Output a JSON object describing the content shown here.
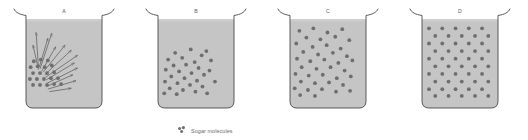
{
  "figure": {
    "title_visible": false,
    "background_color": "#ffffff",
    "liquid_color": "#c5c5c5",
    "liquid_top_highlight": "#cfcfcf",
    "glass_outline_color": "#4a4a4a",
    "molecule_color": "#6e6e6e",
    "arrow_color": "#5f5f5f",
    "label_color": "#5a5a5a"
  },
  "legend": {
    "label": "Sugar molecules",
    "marker_name": "sugar-molecule-cluster",
    "marker_dots": [
      {
        "cx": 2.6,
        "cy": 2.4,
        "r": 1.5
      },
      {
        "cx": 6.4,
        "cy": 1.6,
        "r": 1.6
      },
      {
        "cx": 4.6,
        "cy": 5.4,
        "r": 1.5
      }
    ]
  },
  "beakers": [
    {
      "id": "A",
      "label": "A",
      "x": 14,
      "description": "Sugar crystals clustered at bottom-left, arrows showing molecules dispersing outward",
      "molecule_count": 21,
      "molecules": [
        {
          "cx": 10,
          "cy": 50
        },
        {
          "cx": 19,
          "cy": 48
        },
        {
          "cx": 28,
          "cy": 49
        },
        {
          "cx": 6,
          "cy": 57
        },
        {
          "cx": 15,
          "cy": 56
        },
        {
          "cx": 24,
          "cy": 57
        },
        {
          "cx": 33,
          "cy": 55
        },
        {
          "cx": 9,
          "cy": 64
        },
        {
          "cx": 18,
          "cy": 64
        },
        {
          "cx": 27,
          "cy": 64
        },
        {
          "cx": 36,
          "cy": 63
        },
        {
          "cx": 5,
          "cy": 71
        },
        {
          "cx": 14,
          "cy": 71
        },
        {
          "cx": 23,
          "cy": 71
        },
        {
          "cx": 32,
          "cy": 70
        },
        {
          "cx": 41,
          "cy": 70
        },
        {
          "cx": 9,
          "cy": 78
        },
        {
          "cx": 18,
          "cy": 78
        },
        {
          "cx": 27,
          "cy": 78
        },
        {
          "cx": 36,
          "cy": 77
        },
        {
          "cx": 45,
          "cy": 77
        }
      ],
      "arrows": [
        {
          "x1": 16,
          "y1": 58,
          "x2": 13,
          "y2": 16
        },
        {
          "x1": 17,
          "y1": 57,
          "x2": 28,
          "y2": 23
        },
        {
          "x1": 16,
          "y1": 60,
          "x2": 9,
          "y2": 31
        },
        {
          "x1": 18,
          "y1": 59,
          "x2": 33,
          "y2": 17
        },
        {
          "x1": 20,
          "y1": 62,
          "x2": 38,
          "y2": 33
        },
        {
          "x1": 22,
          "y1": 63,
          "x2": 50,
          "y2": 31
        },
        {
          "x1": 24,
          "y1": 66,
          "x2": 58,
          "y2": 37
        },
        {
          "x1": 25,
          "y1": 69,
          "x2": 66,
          "y2": 43
        },
        {
          "x1": 26,
          "y1": 72,
          "x2": 62,
          "y2": 52
        },
        {
          "x1": 27,
          "y1": 76,
          "x2": 66,
          "y2": 58
        },
        {
          "x1": 26,
          "y1": 80,
          "x2": 60,
          "y2": 66
        },
        {
          "x1": 28,
          "y1": 83,
          "x2": 64,
          "y2": 73
        },
        {
          "x1": 30,
          "y1": 86,
          "x2": 58,
          "y2": 82
        }
      ]
    },
    {
      "id": "B",
      "label": "B",
      "x": 146,
      "description": "Sugar molecules spread through lower two-thirds, denser toward the bottom-left",
      "molecule_count": 30,
      "molecules": [
        {
          "cx": 22,
          "cy": 40
        },
        {
          "cx": 42,
          "cy": 36
        },
        {
          "cx": 56,
          "cy": 43
        },
        {
          "cx": 13,
          "cy": 48
        },
        {
          "cx": 31,
          "cy": 46
        },
        {
          "cx": 47,
          "cy": 51
        },
        {
          "cx": 62,
          "cy": 38
        },
        {
          "cx": 20,
          "cy": 55
        },
        {
          "cx": 36,
          "cy": 54
        },
        {
          "cx": 52,
          "cy": 58
        },
        {
          "cx": 68,
          "cy": 49
        },
        {
          "cx": 10,
          "cy": 60
        },
        {
          "cx": 27,
          "cy": 62
        },
        {
          "cx": 43,
          "cy": 64
        },
        {
          "cx": 59,
          "cy": 66
        },
        {
          "cx": 17,
          "cy": 68
        },
        {
          "cx": 34,
          "cy": 70
        },
        {
          "cx": 50,
          "cy": 73
        },
        {
          "cx": 66,
          "cy": 61
        },
        {
          "cx": 9,
          "cy": 74
        },
        {
          "cx": 25,
          "cy": 76
        },
        {
          "cx": 41,
          "cy": 78
        },
        {
          "cx": 57,
          "cy": 80
        },
        {
          "cx": 73,
          "cy": 74
        },
        {
          "cx": 15,
          "cy": 82
        },
        {
          "cx": 32,
          "cy": 84
        },
        {
          "cx": 48,
          "cy": 86
        },
        {
          "cx": 8,
          "cy": 88
        },
        {
          "cx": 24,
          "cy": 89
        },
        {
          "cx": 63,
          "cy": 88
        }
      ],
      "arrows": []
    },
    {
      "id": "C",
      "label": "C",
      "x": 278,
      "description": "Sugar molecules distributed throughout the liquid but still irregularly spaced",
      "molecule_count": 41,
      "molecules": [
        {
          "cx": 12,
          "cy": 14
        },
        {
          "cx": 30,
          "cy": 11
        },
        {
          "cx": 48,
          "cy": 16
        },
        {
          "cx": 67,
          "cy": 12
        },
        {
          "cx": 21,
          "cy": 22
        },
        {
          "cx": 39,
          "cy": 24
        },
        {
          "cx": 58,
          "cy": 21
        },
        {
          "cx": 76,
          "cy": 25
        },
        {
          "cx": 8,
          "cy": 29
        },
        {
          "cx": 29,
          "cy": 33
        },
        {
          "cx": 47,
          "cy": 31
        },
        {
          "cx": 65,
          "cy": 35
        },
        {
          "cx": 17,
          "cy": 39
        },
        {
          "cx": 36,
          "cy": 42
        },
        {
          "cx": 55,
          "cy": 40
        },
        {
          "cx": 73,
          "cy": 44
        },
        {
          "cx": 9,
          "cy": 47
        },
        {
          "cx": 26,
          "cy": 50
        },
        {
          "cx": 44,
          "cy": 48
        },
        {
          "cx": 62,
          "cy": 52
        },
        {
          "cx": 80,
          "cy": 49
        },
        {
          "cx": 15,
          "cy": 57
        },
        {
          "cx": 34,
          "cy": 59
        },
        {
          "cx": 52,
          "cy": 57
        },
        {
          "cx": 70,
          "cy": 61
        },
        {
          "cx": 7,
          "cy": 65
        },
        {
          "cx": 24,
          "cy": 67
        },
        {
          "cx": 42,
          "cy": 66
        },
        {
          "cx": 60,
          "cy": 70
        },
        {
          "cx": 78,
          "cy": 68
        },
        {
          "cx": 14,
          "cy": 74
        },
        {
          "cx": 32,
          "cy": 76
        },
        {
          "cx": 50,
          "cy": 75
        },
        {
          "cx": 68,
          "cy": 78
        },
        {
          "cx": 6,
          "cy": 82
        },
        {
          "cx": 23,
          "cy": 84
        },
        {
          "cx": 41,
          "cy": 83
        },
        {
          "cx": 59,
          "cy": 86
        },
        {
          "cx": 77,
          "cy": 85
        },
        {
          "cx": 13,
          "cy": 90
        },
        {
          "cx": 32,
          "cy": 91
        }
      ],
      "arrows": []
    },
    {
      "id": "D",
      "label": "D",
      "x": 410,
      "description": "Sugar molecules evenly distributed in a regular staggered lattice — fully dissolved",
      "molecule_count": 50,
      "molecules": [
        {
          "cx": 9,
          "cy": 11
        },
        {
          "cx": 26,
          "cy": 11
        },
        {
          "cx": 43,
          "cy": 11
        },
        {
          "cx": 60,
          "cy": 11
        },
        {
          "cx": 77,
          "cy": 11
        },
        {
          "cx": 17,
          "cy": 20
        },
        {
          "cx": 34,
          "cy": 20
        },
        {
          "cx": 51,
          "cy": 20
        },
        {
          "cx": 68,
          "cy": 20
        },
        {
          "cx": 9,
          "cy": 29
        },
        {
          "cx": 26,
          "cy": 29
        },
        {
          "cx": 43,
          "cy": 29
        },
        {
          "cx": 60,
          "cy": 29
        },
        {
          "cx": 77,
          "cy": 29
        },
        {
          "cx": 17,
          "cy": 38
        },
        {
          "cx": 34,
          "cy": 38
        },
        {
          "cx": 51,
          "cy": 38
        },
        {
          "cx": 68,
          "cy": 38
        },
        {
          "cx": 9,
          "cy": 47
        },
        {
          "cx": 26,
          "cy": 47
        },
        {
          "cx": 43,
          "cy": 47
        },
        {
          "cx": 60,
          "cy": 47
        },
        {
          "cx": 77,
          "cy": 47
        },
        {
          "cx": 17,
          "cy": 56
        },
        {
          "cx": 34,
          "cy": 56
        },
        {
          "cx": 51,
          "cy": 56
        },
        {
          "cx": 68,
          "cy": 56
        },
        {
          "cx": 9,
          "cy": 65
        },
        {
          "cx": 26,
          "cy": 65
        },
        {
          "cx": 43,
          "cy": 65
        },
        {
          "cx": 60,
          "cy": 65
        },
        {
          "cx": 77,
          "cy": 65
        },
        {
          "cx": 17,
          "cy": 74
        },
        {
          "cx": 34,
          "cy": 74
        },
        {
          "cx": 51,
          "cy": 74
        },
        {
          "cx": 68,
          "cy": 74
        },
        {
          "cx": 9,
          "cy": 83
        },
        {
          "cx": 26,
          "cy": 83
        },
        {
          "cx": 43,
          "cy": 83
        },
        {
          "cx": 60,
          "cy": 83
        },
        {
          "cx": 77,
          "cy": 83
        },
        {
          "cx": 17,
          "cy": 91
        },
        {
          "cx": 34,
          "cy": 91
        },
        {
          "cx": 51,
          "cy": 91
        },
        {
          "cx": 68,
          "cy": 91
        },
        {
          "cx": 85,
          "cy": 20
        },
        {
          "cx": 85,
          "cy": 38
        },
        {
          "cx": 85,
          "cy": 56
        },
        {
          "cx": 85,
          "cy": 74
        },
        {
          "cx": 85,
          "cy": 91
        }
      ],
      "arrows": []
    }
  ]
}
